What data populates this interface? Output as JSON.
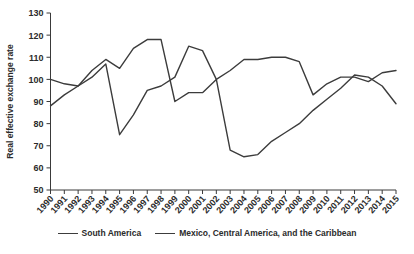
{
  "chart_data": {
    "type": "line",
    "title": "",
    "xlabel": "",
    "ylabel": "Real effective exchange rate",
    "ylim": [
      50,
      130
    ],
    "ytick_step": 10,
    "yticks": [
      50,
      60,
      70,
      80,
      90,
      100,
      110,
      120,
      130
    ],
    "grid": false,
    "legend_position": "bottom-center",
    "categories": [
      "1990",
      "1991",
      "1992",
      "1993",
      "1994",
      "1995",
      "1996",
      "1997",
      "1998",
      "1999",
      "2000",
      "2001",
      "2002",
      "2003",
      "2004",
      "2005",
      "2006",
      "2007",
      "2008",
      "2009",
      "2010",
      "2011",
      "2012",
      "2013",
      "2014",
      "2015"
    ],
    "series": [
      {
        "name": "South America",
        "color": "#3c3c3c",
        "values": [
          100,
          98,
          97,
          104,
          109,
          105,
          114,
          118,
          118,
          90,
          94,
          94,
          100,
          104,
          109,
          109,
          110,
          110,
          108,
          93,
          98,
          101,
          101,
          99,
          103,
          104
        ]
      },
      {
        "name": "Mexico, Central America, and the Caribbean",
        "color": "#3c3c3c",
        "values": [
          88,
          93,
          97,
          101,
          107,
          75,
          84,
          95,
          97,
          101,
          115,
          113,
          100,
          68,
          65,
          66,
          72,
          76,
          80,
          86,
          91,
          96,
          102,
          101,
          97,
          89
        ]
      }
    ]
  },
  "axes": {
    "y_axis_title": "Real effective exchange rate"
  },
  "legend": {
    "entries": [
      {
        "label": "South America",
        "swatch": "line-swatch"
      },
      {
        "label": "Mexico, Central America, and the Caribbean",
        "swatch": "line-swatch"
      }
    ]
  }
}
